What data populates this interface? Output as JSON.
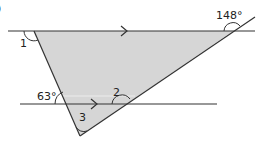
{
  "diagram": {
    "question_marker": ")",
    "colors": {
      "line": "#333333",
      "fill": "#d6d6d6",
      "highlight": "#e8e8e8",
      "text": "#222222"
    },
    "labels": {
      "angle1": "1",
      "angle2": "2",
      "angle3": "3",
      "angle_top_right": "148°",
      "angle_bottom_left": "63°"
    },
    "parallel_lines": [
      {
        "name": "top-line",
        "arrow": true
      },
      {
        "name": "bottom-line",
        "arrow": true
      }
    ],
    "shape": "triangle"
  }
}
